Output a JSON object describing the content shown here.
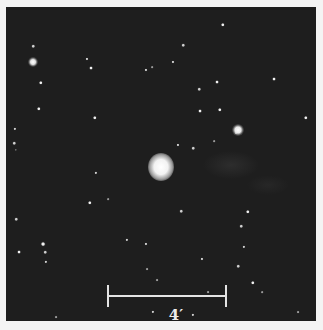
{
  "image": {
    "description": "Astronomical star field with a bright central object (nebula) and surrounding stars",
    "background_color": "#1e1e1e",
    "border_color": "#f4f4f4"
  },
  "scale_bar": {
    "label": "4′",
    "color": "#e4e4e4"
  },
  "objects": [
    {
      "x": 155,
      "y": 160,
      "r": 13,
      "kind": "central-nebula"
    },
    {
      "x": 234,
      "y": 123,
      "r": 5,
      "kind": "bright-star"
    },
    {
      "x": 27,
      "y": 55,
      "r": 4,
      "kind": "bright-star"
    }
  ],
  "stars": [
    [
      27,
      39,
      1.6
    ],
    [
      35,
      76,
      2
    ],
    [
      85,
      61,
      1.8
    ],
    [
      81,
      52,
      1.4
    ],
    [
      33,
      102,
      2
    ],
    [
      9,
      122,
      1.5
    ],
    [
      89,
      111,
      2
    ],
    [
      8,
      136,
      1.6
    ],
    [
      10,
      143,
      1
    ],
    [
      217,
      18,
      2
    ],
    [
      167,
      55,
      1.4
    ],
    [
      177,
      38,
      1.6
    ],
    [
      140,
      63,
      1.4
    ],
    [
      146,
      60,
      1.2
    ],
    [
      211,
      75,
      1.8
    ],
    [
      193,
      82,
      1.6
    ],
    [
      268,
      72,
      1.8
    ],
    [
      194,
      104,
      1.8
    ],
    [
      214,
      103,
      2
    ],
    [
      172,
      138,
      1.4
    ],
    [
      300,
      111,
      2
    ],
    [
      230,
      126,
      1.4
    ],
    [
      208,
      134,
      1.2
    ],
    [
      187,
      141,
      1.6
    ],
    [
      10,
      212,
      1.6
    ],
    [
      84,
      196,
      2
    ],
    [
      37,
      237,
      2.2
    ],
    [
      13,
      245,
      1.8
    ],
    [
      39,
      245,
      1.6
    ],
    [
      40,
      255,
      1.5
    ],
    [
      121,
      233,
      1.5
    ],
    [
      140,
      237,
      1.4
    ],
    [
      90,
      166,
      1.5
    ],
    [
      102,
      192,
      1.2
    ],
    [
      151,
      273,
      1.3
    ],
    [
      141,
      262,
      1.3
    ],
    [
      147,
      305,
      1.5
    ],
    [
      82,
      318,
      2
    ],
    [
      50,
      310,
      1.3
    ],
    [
      175,
      204,
      1.6
    ],
    [
      242,
      205,
      2
    ],
    [
      235,
      219,
      1.6
    ],
    [
      238,
      240,
      1.5
    ],
    [
      232,
      259,
      1.6
    ],
    [
      247,
      276,
      2
    ],
    [
      196,
      252,
      1.4
    ],
    [
      202,
      285,
      1.3
    ],
    [
      187,
      308,
      1.5
    ],
    [
      186,
      317,
      1.5
    ],
    [
      292,
      305,
      1.3
    ],
    [
      256,
      285,
      1.2
    ]
  ]
}
